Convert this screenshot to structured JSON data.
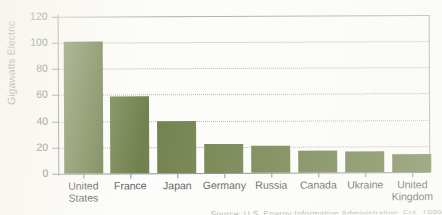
{
  "chart_data": {
    "type": "bar",
    "title": "",
    "xlabel": "",
    "ylabel": "Gigawatts Electric",
    "ylim": [
      0,
      120
    ],
    "yticks": [
      0,
      20,
      40,
      60,
      80,
      100,
      120
    ],
    "grid": "horizontal-dotted",
    "legend": "none",
    "bar_color": "#4f6322",
    "categories": [
      "United States",
      "France",
      "Japan",
      "Germany",
      "Russia",
      "Canada",
      "Ukraine",
      "United Kingdom"
    ],
    "category_lines": [
      [
        "United",
        "States"
      ],
      [
        "France"
      ],
      [
        "Japan"
      ],
      [
        "Germany"
      ],
      [
        "Russia"
      ],
      [
        "Canada"
      ],
      [
        "Ukraine"
      ],
      [
        "United",
        "Kingdom"
      ]
    ],
    "values": [
      101,
      59,
      40,
      22.5,
      21,
      17,
      16,
      14
    ]
  },
  "axis": {
    "y_title": "Gigawatts Electric",
    "ticks": {
      "t0": "0",
      "t20": "20",
      "t40": "40",
      "t60": "60",
      "t80": "80",
      "t100": "100",
      "t120": "120"
    }
  },
  "caption": {
    "text": "Source: U.S. Energy Information Administration, EIA, 1999"
  }
}
